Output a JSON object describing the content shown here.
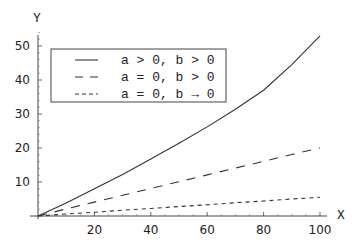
{
  "chart_data": {
    "type": "line",
    "title": "",
    "xlabel": "X",
    "ylabel": "Y",
    "xlim": [
      0,
      100
    ],
    "ylim": [
      0,
      55
    ],
    "grid": false,
    "legend_position": "upper-left (inside)",
    "x_ticks": [
      20,
      40,
      60,
      80,
      100
    ],
    "y_ticks": [
      10,
      20,
      30,
      40,
      50
    ],
    "x": [
      0,
      10,
      20,
      30,
      40,
      50,
      60,
      70,
      80,
      90,
      100
    ],
    "series": [
      {
        "name": "a > 0, b > 0",
        "style": "solid",
        "values": [
          0,
          3.8,
          8,
          12.2,
          16.8,
          21.4,
          26.2,
          31.4,
          37,
          44.5,
          53
        ]
      },
      {
        "name": "a = 0, b > 0",
        "style": "long-dash",
        "values": [
          0,
          2.1,
          4.1,
          6.1,
          8.1,
          10.1,
          12.1,
          14.1,
          16.1,
          18.1,
          20
        ]
      },
      {
        "name": "a = 0, b → 0",
        "style": "short-dash",
        "values": [
          0,
          0.6,
          1.1,
          1.7,
          2.2,
          2.8,
          3.3,
          3.9,
          4.4,
          5,
          5.5
        ]
      }
    ]
  },
  "labels": {
    "x_axis": "X",
    "y_axis": "Y"
  },
  "legend": {
    "items": [
      {
        "label": "a > 0, b > 0",
        "style": "solid"
      },
      {
        "label": "a = 0, b > 0",
        "style": "long-dash"
      },
      {
        "label": "a = 0, b → 0",
        "style": "short-dash"
      }
    ]
  }
}
